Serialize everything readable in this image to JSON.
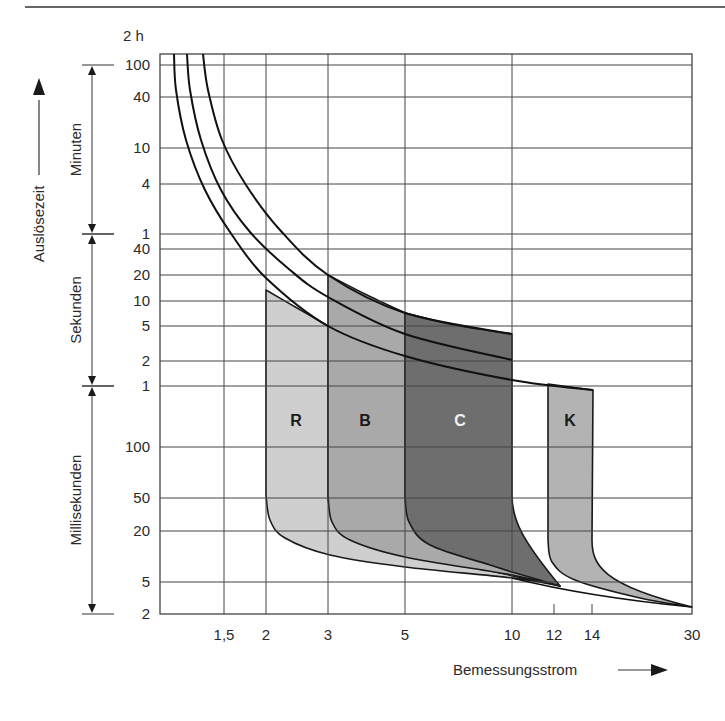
{
  "header": {
    "rule": true
  },
  "chart_data": {
    "type": "area",
    "title": "",
    "xlabel": "Bemessungsstrom",
    "ylabel": "Auslösezeit",
    "x_scale": "log",
    "y_scale": "log",
    "x_ticks": [
      {
        "value": 1.5,
        "label": "1,5"
      },
      {
        "value": 2,
        "label": "2"
      },
      {
        "value": 3,
        "label": "3"
      },
      {
        "value": 5,
        "label": "5"
      },
      {
        "value": 10,
        "label": "10"
      },
      {
        "value": 12,
        "label": "12"
      },
      {
        "value": 14,
        "label": "14"
      },
      {
        "value": 30,
        "label": "30"
      }
    ],
    "y_top_label": "2 h",
    "y_ticks": [
      {
        "label": "100",
        "unit": "min",
        "py": 65
      },
      {
        "label": "40",
        "unit": "min",
        "py": 97
      },
      {
        "label": "10",
        "unit": "min",
        "py": 148
      },
      {
        "label": "4",
        "unit": "min",
        "py": 184
      },
      {
        "label": "1",
        "unit": "min",
        "py": 234
      },
      {
        "label": "40",
        "unit": "s",
        "py": 249
      },
      {
        "label": "20",
        "unit": "s",
        "py": 275
      },
      {
        "label": "10",
        "unit": "s",
        "py": 301
      },
      {
        "label": "5",
        "unit": "s",
        "py": 326
      },
      {
        "label": "2",
        "unit": "s",
        "py": 361
      },
      {
        "label": "1",
        "unit": "s",
        "py": 386
      },
      {
        "label": "100",
        "unit": "ms",
        "py": 447
      },
      {
        "label": "50",
        "unit": "ms",
        "py": 498
      },
      {
        "label": "20",
        "unit": "ms",
        "py": 531
      },
      {
        "label": "5",
        "unit": "ms",
        "py": 582
      },
      {
        "label": "2",
        "unit": "ms",
        "py": 614
      }
    ],
    "y_ranges": [
      {
        "label": "Minuten",
        "from_py": 65,
        "to_py": 234
      },
      {
        "label": "Sekunden",
        "from_py": 234,
        "to_py": 386
      },
      {
        "label": "Millisekunden",
        "from_py": 386,
        "to_py": 614
      }
    ],
    "series": [
      {
        "name": "R",
        "x_from": 2,
        "x_to": 3,
        "fill": "#cfcfcf",
        "label_color": "#1a1a1a",
        "top": [
          [
            266,
            290
          ],
          [
            297,
            308
          ],
          [
            328,
            326
          ]
        ],
        "bottom_knee": [
          [
            266,
            495
          ],
          [
            270,
            520
          ],
          [
            285,
            538
          ],
          [
            330,
            555
          ],
          [
            405,
            567
          ],
          [
            512,
            578
          ],
          [
            560,
            586
          ]
        ]
      },
      {
        "name": "B",
        "x_from": 3,
        "x_to": 5,
        "fill": "#a9a9a9",
        "label_color": "#1a1a1a",
        "top": [
          [
            328,
            275
          ],
          [
            365,
            294
          ],
          [
            405,
            313
          ]
        ],
        "bottom_knee": [
          [
            328,
            495
          ],
          [
            332,
            522
          ],
          [
            350,
            540
          ],
          [
            405,
            557
          ],
          [
            512,
            575
          ],
          [
            560,
            586
          ]
        ]
      },
      {
        "name": "C",
        "x_from": 5,
        "x_to": 10,
        "fill": "#6e6e6e",
        "label_color": "#f2f2f2",
        "top": [
          [
            405,
            313
          ],
          [
            455,
            325
          ],
          [
            512,
            334
          ]
        ],
        "bottom_knee": [
          [
            405,
            495
          ],
          [
            409,
            522
          ],
          [
            430,
            545
          ],
          [
            490,
            565
          ],
          [
            512,
            572
          ],
          [
            560,
            586
          ]
        ]
      },
      {
        "name": "K",
        "x_from": 12,
        "x_to": 14,
        "fill": "#b3b3b3",
        "label_color": "#1a1a1a",
        "top": [
          [
            548,
            384
          ],
          [
            593,
            390
          ]
        ],
        "bottom_knee": [
          [
            548,
            540
          ],
          [
            552,
            562
          ],
          [
            575,
            580
          ],
          [
            640,
            598
          ],
          [
            692,
            607
          ]
        ]
      }
    ],
    "curves": [
      {
        "name": "lower",
        "points": [
          [
            174,
            54
          ],
          [
            176,
            90
          ],
          [
            186,
            140
          ],
          [
            205,
            190
          ],
          [
            232,
            235
          ],
          [
            266,
            278
          ],
          [
            328,
            326
          ],
          [
            405,
            356
          ],
          [
            512,
            380
          ],
          [
            593,
            390
          ]
        ]
      },
      {
        "name": "middle",
        "points": [
          [
            187,
            54
          ],
          [
            190,
            90
          ],
          [
            201,
            140
          ],
          [
            221,
            190
          ],
          [
            250,
            232
          ],
          [
            290,
            270
          ],
          [
            328,
            297
          ],
          [
            405,
            334
          ],
          [
            512,
            360
          ]
        ]
      },
      {
        "name": "upper",
        "points": [
          [
            203,
            54
          ],
          [
            208,
            90
          ],
          [
            222,
            140
          ],
          [
            246,
            185
          ],
          [
            280,
            230
          ],
          [
            328,
            275
          ],
          [
            405,
            313
          ],
          [
            512,
            334
          ]
        ]
      }
    ],
    "grid": true,
    "legend": null,
    "region_labels": [
      {
        "text": "R",
        "px": 296,
        "py": 426
      },
      {
        "text": "B",
        "px": 365,
        "py": 426
      },
      {
        "text": "C",
        "px": 460,
        "py": 426
      },
      {
        "text": "K",
        "px": 570,
        "py": 426
      }
    ]
  }
}
